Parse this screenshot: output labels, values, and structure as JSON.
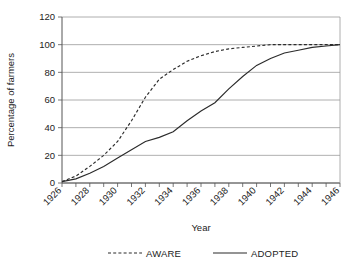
{
  "chart_data": {
    "type": "line",
    "title": "",
    "xlabel": "Year",
    "ylabel": "Percentage of farmers",
    "xlim": [
      1926,
      1946
    ],
    "ylim": [
      0,
      120
    ],
    "ytick_step": 20,
    "yticks": [
      0,
      20,
      40,
      60,
      80,
      100,
      120
    ],
    "xticks_major": [
      1926,
      1928,
      1930,
      1932,
      1934,
      1936,
      1938,
      1940,
      1942,
      1944,
      1946
    ],
    "xticks_minor": [
      1927,
      1929,
      1931,
      1933,
      1935,
      1937,
      1939,
      1941,
      1943,
      1945
    ],
    "xtick_labels": [
      "1926",
      "1928",
      "1930",
      "1932",
      "1934",
      "1936",
      "1938",
      "1940",
      "1942",
      "1944",
      "1946"
    ],
    "xtick_label_rotation": -45,
    "grid": "horizontal",
    "legend_position": "bottom",
    "x": [
      1926,
      1927,
      1928,
      1929,
      1930,
      1931,
      1932,
      1933,
      1934,
      1935,
      1936,
      1937,
      1938,
      1939,
      1940,
      1941,
      1942,
      1943,
      1944,
      1945,
      1946
    ],
    "series": [
      {
        "name": "AWARE",
        "style": "dashed",
        "color": "#2b2b2b",
        "values": [
          1,
          5,
          12,
          20,
          30,
          45,
          62,
          75,
          82,
          88,
          92,
          95,
          97,
          98,
          99,
          100,
          100,
          100,
          100,
          100,
          100
        ]
      },
      {
        "name": "ADOPTED",
        "style": "solid",
        "color": "#2b2b2b",
        "values": [
          1,
          3,
          7,
          12,
          18,
          24,
          30,
          33,
          37,
          45,
          52,
          58,
          68,
          77,
          85,
          90,
          94,
          96,
          98,
          99,
          100
        ]
      }
    ]
  },
  "legend": {
    "items": [
      {
        "label": "AWARE",
        "style": "dashed"
      },
      {
        "label": "ADOPTED",
        "style": "solid"
      }
    ]
  },
  "axes": {
    "x_title": "Year",
    "y_title": "Percentage of farmers"
  }
}
